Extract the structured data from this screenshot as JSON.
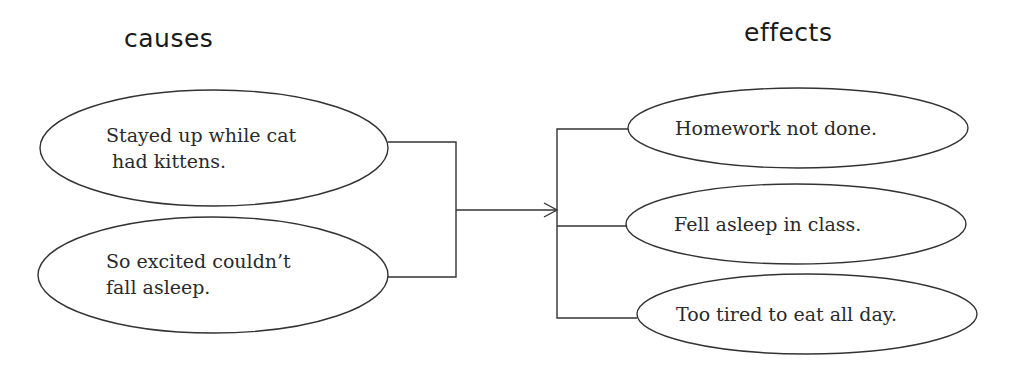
{
  "headings": {
    "causes": "causes",
    "effects": "effects"
  },
  "causes": [
    {
      "line1": "Stayed up while cat",
      "line2": " had kittens."
    },
    {
      "line1": "So excited couldn’t",
      "line2": "fall asleep."
    }
  ],
  "effects": [
    {
      "text": "Homework not done."
    },
    {
      "text": "Fell asleep in class."
    },
    {
      "text": "Too tired to eat all day."
    }
  ],
  "colors": {
    "stroke": "#333333",
    "background": "#ffffff",
    "text": "#2a2a2a"
  }
}
